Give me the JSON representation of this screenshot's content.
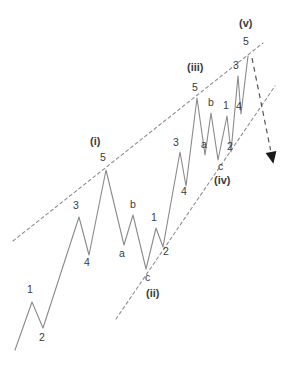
{
  "diagram": {
    "type": "elliott-wave-schematic",
    "canvas": {
      "width": 292,
      "height": 368
    },
    "colors": {
      "background": "#ffffff",
      "wave_line": "#8a8a8a",
      "trendline": "#8f8f8f",
      "arrow": "#1a1a1a",
      "label_text": "#3b3b3b"
    },
    "wave_path_points": [
      [
        15,
        350
      ],
      [
        32,
        302
      ],
      [
        43,
        328
      ],
      [
        79,
        217
      ],
      [
        89,
        255
      ],
      [
        106,
        170
      ],
      [
        124,
        245
      ],
      [
        133,
        215
      ],
      [
        146,
        269
      ],
      [
        156,
        228
      ],
      [
        163,
        247
      ],
      [
        180,
        152
      ],
      [
        186,
        186
      ],
      [
        197,
        98
      ],
      [
        205,
        155
      ],
      [
        211,
        113
      ],
      [
        218,
        160
      ],
      [
        227,
        116
      ],
      [
        231,
        152
      ],
      [
        238,
        76
      ],
      [
        241,
        114
      ],
      [
        248,
        56
      ]
    ],
    "upper_trendline": {
      "x1": 13,
      "y1": 241,
      "x2": 263,
      "y2": 43
    },
    "lower_trendline": {
      "x1": 116,
      "y1": 319,
      "x2": 275,
      "y2": 86
    },
    "forecast_arrow": {
      "x1": 252,
      "y1": 58,
      "x2": 271,
      "y2": 152
    },
    "labels": [
      {
        "name": "label-wave-1",
        "text": "1",
        "x": 27,
        "y": 284,
        "degree": false
      },
      {
        "name": "label-wave-2",
        "text": "2",
        "x": 39,
        "y": 332,
        "degree": false
      },
      {
        "name": "label-wave-3",
        "text": "3",
        "x": 73,
        "y": 200,
        "degree": false
      },
      {
        "name": "label-wave-4",
        "text": "4",
        "x": 84,
        "y": 257,
        "degree": false
      },
      {
        "name": "label-degree-i",
        "text": "(i)",
        "x": 90,
        "y": 136,
        "degree": true
      },
      {
        "name": "label-wave-5-i",
        "text": "5",
        "x": 100,
        "y": 152,
        "degree": false
      },
      {
        "name": "label-wave-a-1",
        "text": "a",
        "x": 119,
        "y": 248,
        "degree": false
      },
      {
        "name": "label-wave-b-1",
        "text": "b",
        "x": 130,
        "y": 199,
        "degree": false
      },
      {
        "name": "label-wave-c-1",
        "text": "c",
        "x": 145,
        "y": 272,
        "degree": false
      },
      {
        "name": "label-degree-ii",
        "text": "(ii)",
        "x": 146,
        "y": 288,
        "degree": true
      },
      {
        "name": "label-wave-1-b",
        "text": "1",
        "x": 151,
        "y": 212,
        "degree": false
      },
      {
        "name": "label-wave-2-b",
        "text": "2",
        "x": 163,
        "y": 246,
        "degree": false
      },
      {
        "name": "label-wave-3-b",
        "text": "3",
        "x": 173,
        "y": 137,
        "degree": false
      },
      {
        "name": "label-wave-4-b",
        "text": "4",
        "x": 181,
        "y": 186,
        "degree": false
      },
      {
        "name": "label-degree-iii",
        "text": "(iii)",
        "x": 187,
        "y": 62,
        "degree": true
      },
      {
        "name": "label-wave-5-iii",
        "text": "5",
        "x": 192,
        "y": 82,
        "degree": false
      },
      {
        "name": "label-wave-a-2",
        "text": "a",
        "x": 201,
        "y": 139,
        "degree": false
      },
      {
        "name": "label-wave-b-2",
        "text": "b",
        "x": 208,
        "y": 97,
        "degree": false
      },
      {
        "name": "label-wave-1-c",
        "text": "1",
        "x": 223,
        "y": 100,
        "degree": false
      },
      {
        "name": "label-wave-2-c",
        "text": "2",
        "x": 227,
        "y": 141,
        "degree": false
      },
      {
        "name": "label-wave-c-2",
        "text": "c",
        "x": 218,
        "y": 161,
        "degree": false
      },
      {
        "name": "label-degree-iv",
        "text": "(iv)",
        "x": 214,
        "y": 175,
        "degree": true
      },
      {
        "name": "label-wave-3-c",
        "text": "3",
        "x": 233,
        "y": 60,
        "degree": false
      },
      {
        "name": "label-wave-4-c",
        "text": "4",
        "x": 236,
        "y": 101,
        "degree": false
      },
      {
        "name": "label-degree-v",
        "text": "(v)",
        "x": 239,
        "y": 18,
        "degree": true
      },
      {
        "name": "label-wave-5-v",
        "text": "5",
        "x": 243,
        "y": 36,
        "degree": false
      }
    ]
  }
}
